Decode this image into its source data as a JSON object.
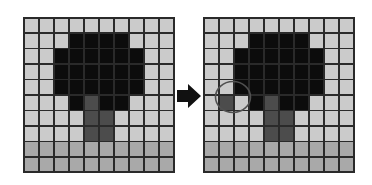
{
  "diagram": {
    "legend_colors": {
      "l": "#cbcbcb",
      "m": "#a9a9a9",
      "d": "#4c4c4c",
      "k": "#0c0c0c"
    },
    "left_grid": {
      "rows": [
        "llllllllll",
        "lllkkkklll",
        "llkkkkkkll",
        "llkkkkkkll",
        "llkkkkkkll",
        "lllkdkklll",
        "lllldd llll",
        "lllldd llll",
        "mmmmmmmmmm",
        "mmmmmmmmmm"
      ]
    },
    "right_grid": {
      "rows": [
        "llllllllll",
        "lllkkkklll",
        "llkkkkkkll",
        "llkkkkkkll",
        "llkkkkkkll",
        "ldlkdkklll",
        "lllldd llll",
        "lllldd llll",
        "mmmmmmmmmm",
        "mmmmmmmmmm"
      ],
      "highlighted_cell": {
        "row": 5,
        "col": 1
      }
    },
    "arrow": {
      "icon": "right-arrow-icon",
      "direction": "right"
    }
  }
}
